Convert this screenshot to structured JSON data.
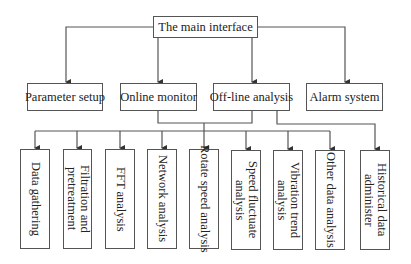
{
  "diagram": {
    "root": {
      "label": "The main interface"
    },
    "level1": [
      {
        "label": "Parameter setup"
      },
      {
        "label": "Online monitor"
      },
      {
        "label": "Off-line analysis"
      },
      {
        "label": "Alarm system"
      }
    ],
    "level2": [
      {
        "label": "Data gathering"
      },
      {
        "label": "Filtration and\npretreatment"
      },
      {
        "label": "FFT analysis"
      },
      {
        "label": "Network analysis"
      },
      {
        "label": "Rotate speed analysis"
      },
      {
        "label": "Speed fluctuate\nanalysis"
      },
      {
        "label": "Vibration trend\nanalysis"
      },
      {
        "label": "Other data analysis"
      },
      {
        "label": "Historical data\nadminister"
      }
    ],
    "edges": [
      [
        "The main interface",
        "Parameter setup"
      ],
      [
        "The main interface",
        "Online monitor"
      ],
      [
        "The main interface",
        "Off-line analysis"
      ],
      [
        "The main interface",
        "Alarm system"
      ],
      [
        "Online monitor + Off-line analysis",
        "Data gathering"
      ],
      [
        "Online monitor + Off-line analysis",
        "Filtration and pretreatment"
      ],
      [
        "Online monitor + Off-line analysis",
        "FFT analysis"
      ],
      [
        "Online monitor + Off-line analysis",
        "Network analysis"
      ],
      [
        "Online monitor + Off-line analysis",
        "Rotate speed analysis"
      ],
      [
        "Online monitor + Off-line analysis",
        "Speed fluctuate analysis"
      ],
      [
        "Online monitor + Off-line analysis",
        "Vibration trend analysis"
      ],
      [
        "Online monitor + Off-line analysis",
        "Other data analysis"
      ],
      [
        "Off-line analysis",
        "Historical data administer"
      ]
    ]
  }
}
